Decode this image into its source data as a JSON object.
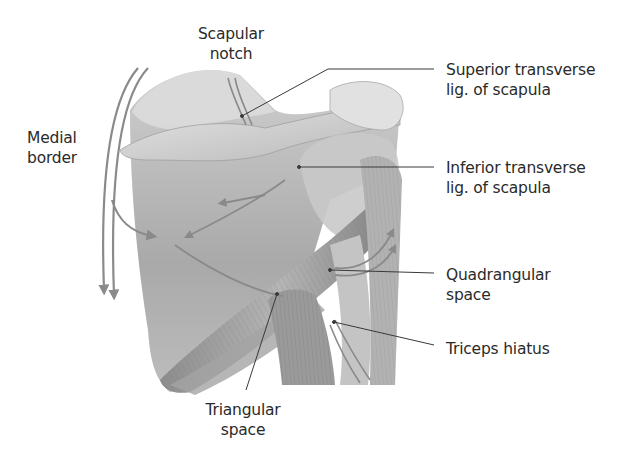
{
  "figure": {
    "labels": {
      "scapular_notch": {
        "line1": "Scapular",
        "line2": "notch"
      },
      "medial_border": {
        "line1": "Medial",
        "line2": "border"
      },
      "superior_transverse": {
        "line1": "Superior transverse",
        "line2": "lig. of scapula"
      },
      "inferior_transverse": {
        "line1": "Inferior transverse",
        "line2": "lig. of scapula"
      },
      "quadrangular_space": {
        "line1": "Quadrangular",
        "line2": "space"
      },
      "triceps_hiatus": {
        "line1": "Triceps hiatus"
      },
      "triangular_space": {
        "line1": "Triangular",
        "line2": "space"
      }
    },
    "colors": {
      "arrow": "#8a8a8a",
      "bone": "#d9d9d9",
      "muscle": "#9c9c9c",
      "leader": "#3a3a3a",
      "text": "#2a2a2a"
    }
  }
}
